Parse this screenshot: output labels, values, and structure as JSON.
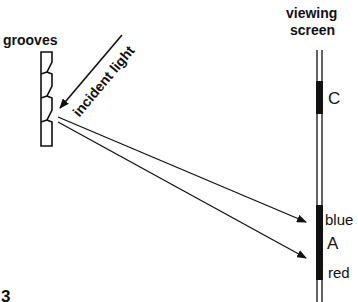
{
  "figure": {
    "number_label": "3",
    "grating": {
      "label": "grooves",
      "groove_count": 4
    },
    "incident_ray": {
      "label": "incident light"
    },
    "screen": {
      "label_line1": "viewing",
      "label_line2": "screen",
      "regions": [
        {
          "id": "C",
          "label": "C"
        },
        {
          "id": "A",
          "label": "A",
          "top_label": "blue",
          "bottom_label": "red"
        }
      ]
    },
    "diffracted_rays": [
      {
        "target": "blue end of A"
      },
      {
        "target": "red end of A"
      }
    ],
    "colors": {
      "ink": "#111111",
      "background": "#ffffff"
    }
  }
}
